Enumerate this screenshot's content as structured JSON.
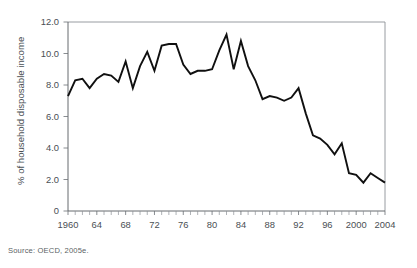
{
  "source_note": "Source: OECD, 2005e.",
  "chart_data": {
    "type": "line",
    "title": "",
    "xlabel": "",
    "ylabel": "% of household disposable income",
    "xlim": [
      1960,
      2004
    ],
    "ylim": [
      0,
      12
    ],
    "grid": false,
    "legend": null,
    "ytick_labels": [
      "12.0",
      "10.0",
      "8.0",
      "6.0",
      "4.0",
      "2.0",
      "0"
    ],
    "ytick_values": [
      12.0,
      10.0,
      8.0,
      6.0,
      4.0,
      2.0,
      0
    ],
    "xtick_labels": [
      "1960",
      "64",
      "68",
      "72",
      "76",
      "80",
      "84",
      "88",
      "92",
      "96",
      "2000",
      "2004"
    ],
    "xtick_values": [
      1960,
      1964,
      1968,
      1972,
      1976,
      1980,
      1984,
      1988,
      1992,
      1996,
      2000,
      2004
    ],
    "x_minor_tick_step": 1,
    "line_color": "#101010",
    "series": [
      {
        "name": "Household saving rate",
        "x": [
          1960,
          1961,
          1962,
          1963,
          1964,
          1965,
          1966,
          1967,
          1968,
          1969,
          1970,
          1971,
          1972,
          1973,
          1974,
          1975,
          1976,
          1977,
          1978,
          1979,
          1980,
          1981,
          1982,
          1983,
          1984,
          1985,
          1986,
          1987,
          1988,
          1989,
          1990,
          1991,
          1992,
          1993,
          1994,
          1995,
          1996,
          1997,
          1998,
          1999,
          2000,
          2001,
          2002,
          2003,
          2004
        ],
        "values": [
          7.3,
          8.3,
          8.4,
          7.8,
          8.4,
          8.7,
          8.6,
          8.2,
          9.5,
          7.8,
          9.2,
          10.1,
          8.9,
          10.5,
          10.6,
          10.6,
          9.3,
          8.7,
          8.9,
          8.9,
          9.0,
          10.2,
          11.2,
          9.0,
          10.8,
          9.2,
          8.3,
          7.1,
          7.3,
          7.2,
          7.0,
          7.2,
          7.8,
          6.2,
          4.8,
          4.6,
          4.2,
          3.6,
          4.3,
          2.4,
          2.3,
          1.8,
          2.4,
          2.1,
          1.8
        ]
      }
    ]
  }
}
